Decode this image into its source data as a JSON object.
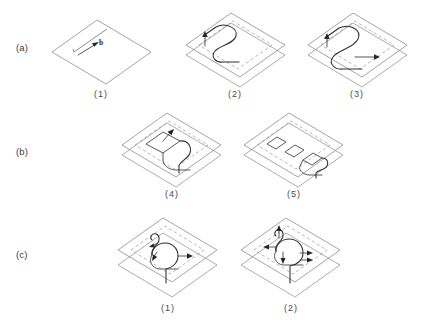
{
  "figure": {
    "background_color": "#ffffff",
    "line_color": "#2f2f2f",
    "plane_color": "#7d7d7d",
    "dashed_color": "#8f8f8f",
    "width": 423,
    "height": 326
  },
  "rows": [
    {
      "label": "(a)",
      "panels": [
        {
          "caption": "(1)",
          "description": "single slip plane with cut line and Burgers vector arrow",
          "annotation": "b"
        },
        {
          "caption": "(2)",
          "description": "two parallel slip planes with S-shaped dislocation line and upward arrow"
        },
        {
          "caption": "(3)",
          "description": "two parallel slip planes with extended S-shaped dislocation and rightward arrow"
        }
      ]
    },
    {
      "label": "(b)",
      "panels": [
        {
          "caption": "(4)",
          "description": "elongated dipole loop on upper plane with trailing dislocation and arrow"
        },
        {
          "caption": "(5)",
          "description": "three prismatic loops pinched off on the upper plane with residual dislocation hook"
        }
      ]
    },
    {
      "label": "(c)",
      "panels": [
        {
          "caption": "(1)",
          "description": "two planes with helical dislocation segment, small loop and directional arrows"
        },
        {
          "caption": "(2)",
          "description": "two planes with helical dislocation and multiple directional arrows"
        }
      ]
    }
  ],
  "labels": {
    "row_a": "(a)",
    "row_b": "(b)",
    "row_c": "(c)",
    "cap_1": "(1)",
    "cap_2": "(2)",
    "cap_3": "(3)",
    "cap_4": "(4)",
    "cap_5": "(5)",
    "cap_c1": "(1)",
    "cap_c2": "(2)",
    "burgers": "b"
  }
}
